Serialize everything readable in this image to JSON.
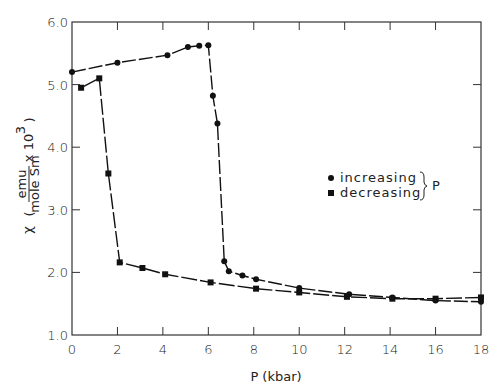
{
  "chart_data": {
    "type": "line",
    "title": "",
    "xlabel": "P (kbar)",
    "ylabel": "χ (emu / mole Sm x 10^3)",
    "ylabel_parts": {
      "symbol": "χ",
      "numerator": "emu",
      "denominator": "mole Sm",
      "multiplier": "x 10",
      "exponent": "3"
    },
    "xlim": [
      0,
      18
    ],
    "ylim": [
      1.0,
      6.0
    ],
    "xticks": [
      0,
      2,
      4,
      6,
      8,
      10,
      12,
      14,
      16,
      18
    ],
    "xtick_labels": [
      "0",
      "2",
      "4",
      "6",
      "8",
      "10",
      "12",
      "14",
      "16",
      "18"
    ],
    "yticks": [
      1.0,
      2.0,
      3.0,
      4.0,
      5.0,
      6.0
    ],
    "ytick_labels": [
      "1.0",
      "2.0",
      "3.0",
      "4.0",
      "5.0",
      "6.0"
    ],
    "grid": false,
    "legend": {
      "position": "center-right",
      "entries": [
        {
          "label": "increasing",
          "marker": "circle"
        },
        {
          "label": "decreasing",
          "marker": "square"
        }
      ],
      "brace_label": "P"
    },
    "series": [
      {
        "name": "increasing",
        "marker": "circle",
        "x": [
          0,
          2,
          4.2,
          5.1,
          5.6,
          6.0,
          6.2,
          6.4,
          6.7,
          6.9,
          7.5,
          8.1,
          10,
          12.2,
          14.1,
          16,
          18
        ],
        "y": [
          5.2,
          5.35,
          5.47,
          5.6,
          5.62,
          5.63,
          4.82,
          4.38,
          2.18,
          2.02,
          1.95,
          1.89,
          1.75,
          1.65,
          1.6,
          1.55,
          1.53
        ]
      },
      {
        "name": "decreasing",
        "marker": "square",
        "x": [
          18,
          16,
          14.1,
          12.1,
          10,
          8.1,
          6.1,
          4.1,
          3.1,
          2.1,
          1.6,
          1.2,
          0.4
        ],
        "y": [
          1.6,
          1.58,
          1.58,
          1.61,
          1.68,
          1.74,
          1.84,
          1.97,
          2.07,
          2.16,
          3.58,
          5.1,
          4.95
        ]
      }
    ]
  }
}
